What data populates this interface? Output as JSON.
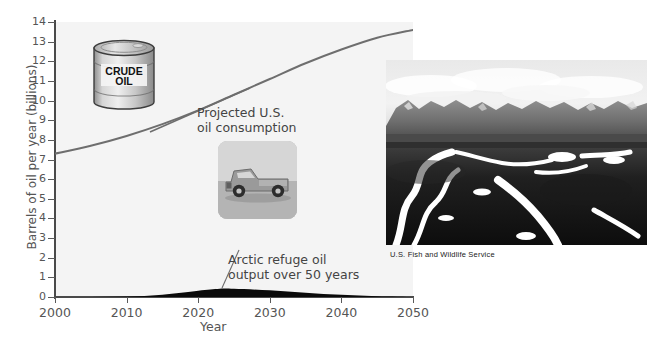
{
  "figure": {
    "name": "arctic-refuge-oil-vs-us-consumption"
  },
  "chart_data": {
    "type": "line",
    "title": "",
    "xlabel": "Year",
    "ylabel": "Barrels of oil per year (billions)",
    "xlim": [
      2000,
      2050
    ],
    "ylim": [
      0,
      14
    ],
    "grid": false,
    "legend_position": "annotations-inline",
    "xticks": [
      2000,
      2010,
      2020,
      2030,
      2040,
      2050
    ],
    "yticks": [
      0,
      1,
      2,
      3,
      4,
      5,
      6,
      7,
      8,
      9,
      10,
      11,
      12,
      13,
      14
    ],
    "series": [
      {
        "name": "Projected U.S. oil consumption",
        "render": "line",
        "color": "#6e6e6e",
        "x": [
          2000,
          2005,
          2010,
          2015,
          2020,
          2025,
          2030,
          2035,
          2040,
          2045,
          2050
        ],
        "values": [
          7.3,
          7.7,
          8.2,
          8.8,
          9.5,
          10.3,
          11.1,
          11.9,
          12.6,
          13.2,
          13.6
        ]
      },
      {
        "name": "Arctic refuge oil output over 50 years",
        "render": "area",
        "color": "#0a0a0a",
        "x": [
          2000,
          2005,
          2010,
          2015,
          2020,
          2023,
          2025,
          2030,
          2035,
          2040,
          2045,
          2050
        ],
        "values": [
          0.0,
          0.0,
          0.02,
          0.12,
          0.32,
          0.42,
          0.42,
          0.34,
          0.22,
          0.11,
          0.04,
          0.0
        ]
      }
    ],
    "annotations": [
      {
        "id": "projected-consumption",
        "line1": "Projected U.S.",
        "line2": "oil consumption",
        "leader": true
      },
      {
        "id": "arctic-output",
        "line1": "Arctic refuge oil",
        "line2": "output over 50 years",
        "leader": true
      }
    ]
  },
  "graphics": {
    "barrel": {
      "name": "crude-oil-barrel",
      "label_line1": "CRUDE",
      "label_line2": "OIL"
    },
    "truck": {
      "name": "pickup-truck-photo"
    },
    "tundra": {
      "name": "arctic-tundra-photo",
      "caption": "U.S. Fish and Wildlife Service"
    }
  },
  "colors": {
    "plot_background": "#f4f4f4",
    "axis": "#4a4a4a",
    "consumption_line": "#6e6e6e",
    "arctic_area": "#0a0a0a",
    "text": "#555555"
  }
}
